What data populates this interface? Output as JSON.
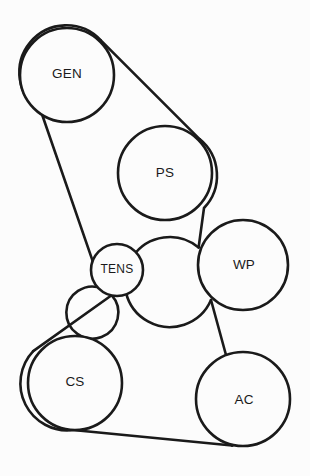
{
  "diagram": {
    "type": "belt-routing",
    "canvas": {
      "width": 310,
      "height": 476
    },
    "colors": {
      "background": "#fcfcfc",
      "stroke": "#1a1a1a",
      "pulley_fill": "#fcfcfc"
    },
    "pulleys": [
      {
        "id": "gen",
        "label": "GEN",
        "name": "Generator / Alternator",
        "cx": 67,
        "cy": 75,
        "r": 47,
        "label_x": 67,
        "label_y": 74
      },
      {
        "id": "ps",
        "label": "PS",
        "name": "Power Steering",
        "cx": 165,
        "cy": 173,
        "r": 47,
        "label_x": 165,
        "label_y": 173
      },
      {
        "id": "wp",
        "label": "WP",
        "name": "Water Pump",
        "cx": 243,
        "cy": 265,
        "r": 45,
        "label_x": 244,
        "label_y": 265
      },
      {
        "id": "tens",
        "label": "TENS",
        "name": "Belt Tensioner",
        "cx": 117,
        "cy": 270,
        "r": 26,
        "label_x": 117,
        "label_y": 270
      },
      {
        "id": "cs",
        "label": "CS",
        "name": "Crankshaft",
        "cx": 75,
        "cy": 383,
        "r": 47,
        "label_x": 75,
        "label_y": 382
      },
      {
        "id": "ac",
        "label": "AC",
        "name": "Air Conditioning Compressor",
        "cx": 243,
        "cy": 399,
        "r": 47,
        "label_x": 244,
        "label_y": 400
      }
    ],
    "belt": {
      "segments": [
        {
          "from": "gen",
          "to": "ps",
          "description": "upper diagonal span from generator top-right to power steering top-right"
        },
        {
          "from": "ps",
          "to": "wp",
          "description": "near-vertical span from power steering right side to water pump left side"
        },
        {
          "from": "wp",
          "to": "ac",
          "description": "crossing diagonal from water pump lower-left to air conditioning right side"
        },
        {
          "from": "ac",
          "to": "cs",
          "description": "bottom span from air conditioning bottom to crankshaft bottom"
        },
        {
          "from": "cs",
          "to": "tens",
          "description": "crossing diagonal from crankshaft upper-left to tensioner lower-right"
        },
        {
          "from": "tens",
          "to": "gen",
          "description": "long diagonal from tensioner upper-right to generator lower-left"
        }
      ],
      "path_d": "M 104.4 32.1 A 47 47 0 1 0 30.4 97.6 L 100.6 285.4 A 26 26 0 1 0 137.3 249.2 L 196.0 204.1 A 47 47 0 1 1 202.0 226.8 L 205.8 365.2 A 47 47 0 1 0 221.6 441.2 L 39.5 412.2 A 47 47 0 1 0 112.8 347.1 Z"
    }
  }
}
